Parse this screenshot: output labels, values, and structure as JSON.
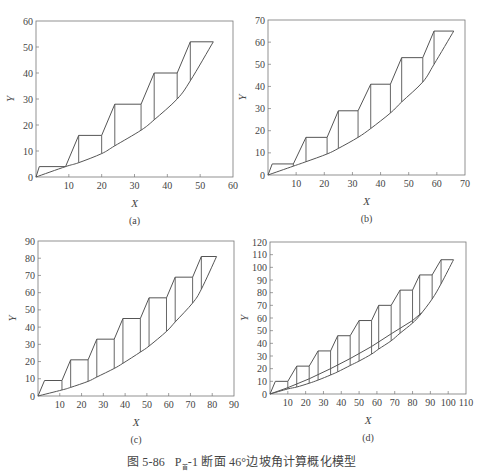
{
  "caption": {
    "figure_no": "图 5-86",
    "section_prefix": "P",
    "section_sub": "首",
    "section_suffix": "-1 断面 46°边坡角计算概化模型"
  },
  "chart_data": [
    {
      "id": "a",
      "type": "line",
      "panel_label": "(a)",
      "xlabel": "X",
      "ylabel": "Y",
      "xlim": [
        0,
        60
      ],
      "ylim": [
        0,
        60
      ],
      "xticks": [
        10,
        20,
        30,
        40,
        50,
        60
      ],
      "yticks": [
        0,
        10,
        20,
        30,
        40,
        50,
        60
      ],
      "frame_px": {
        "left": 36,
        "top": 21,
        "right": 233,
        "bottom": 177
      },
      "series": [
        {
          "name": "slope-profile",
          "points": [
            [
              0,
              0
            ],
            [
              1,
              4
            ],
            [
              9,
              4
            ],
            [
              13,
              16
            ],
            [
              20,
              16
            ],
            [
              24,
              28
            ],
            [
              32,
              28
            ],
            [
              36,
              40
            ],
            [
              43,
              40
            ],
            [
              47,
              52
            ],
            [
              54,
              52
            ]
          ]
        },
        {
          "name": "slip-surface",
          "points": [
            [
              0,
              0
            ],
            [
              9,
              4
            ],
            [
              13,
              5.5
            ],
            [
              20,
              9
            ],
            [
              24,
              12
            ],
            [
              32,
              18
            ],
            [
              36,
              22
            ],
            [
              43,
              30
            ],
            [
              47,
              37
            ],
            [
              54,
              52
            ]
          ]
        }
      ],
      "slice_lines_x": [
        9,
        13,
        20,
        24,
        32,
        36,
        43,
        47
      ]
    },
    {
      "id": "b",
      "type": "line",
      "panel_label": "(b)",
      "xlabel": "X",
      "ylabel": "Y",
      "xlim": [
        0,
        70
      ],
      "ylim": [
        0,
        70
      ],
      "xticks": [
        10,
        20,
        30,
        40,
        50,
        60,
        70
      ],
      "yticks": [
        0,
        10,
        20,
        30,
        40,
        50,
        60,
        70
      ],
      "frame_px": {
        "left": 268,
        "top": 20,
        "right": 465,
        "bottom": 175
      },
      "series": [
        {
          "name": "slope-profile",
          "points": [
            [
              0,
              0
            ],
            [
              1.5,
              5
            ],
            [
              9,
              5
            ],
            [
              13.5,
              17
            ],
            [
              21,
              17
            ],
            [
              25,
              29
            ],
            [
              32,
              29
            ],
            [
              36.5,
              41
            ],
            [
              43.5,
              41
            ],
            [
              47.5,
              53
            ],
            [
              55,
              53
            ],
            [
              59,
              65
            ],
            [
              66,
              65
            ]
          ]
        },
        {
          "name": "slip-surface",
          "points": [
            [
              0,
              0
            ],
            [
              9,
              4
            ],
            [
              13.5,
              6
            ],
            [
              21,
              9.5
            ],
            [
              25,
              12
            ],
            [
              32,
              17
            ],
            [
              36.5,
              21
            ],
            [
              43.5,
              28
            ],
            [
              47.5,
              33
            ],
            [
              55,
              42
            ],
            [
              59,
              50
            ],
            [
              66,
              65
            ]
          ]
        }
      ],
      "slice_lines_x": [
        9,
        13.5,
        21,
        25,
        32,
        36.5,
        43.5,
        47.5,
        55,
        59
      ]
    },
    {
      "id": "c",
      "type": "line",
      "panel_label": "(c)",
      "xlabel": "X",
      "ylabel": "Y",
      "xlim": [
        0,
        90
      ],
      "ylim": [
        0,
        90
      ],
      "xticks": [
        10,
        20,
        30,
        40,
        50,
        60,
        70,
        80,
        90
      ],
      "yticks": [
        0,
        10,
        20,
        30,
        40,
        50,
        60,
        70,
        80,
        90
      ],
      "frame_px": {
        "left": 38,
        "top": 241,
        "right": 234,
        "bottom": 396
      },
      "series": [
        {
          "name": "slope-profile",
          "points": [
            [
              0,
              0
            ],
            [
              3,
              9
            ],
            [
              11,
              9
            ],
            [
              15,
              21
            ],
            [
              23,
              21
            ],
            [
              27,
              33
            ],
            [
              35,
              33
            ],
            [
              39,
              45
            ],
            [
              47,
              45
            ],
            [
              51,
              57
            ],
            [
              59,
              57
            ],
            [
              63,
              69
            ],
            [
              71,
              69
            ],
            [
              75,
              81
            ],
            [
              82,
              81
            ]
          ]
        },
        {
          "name": "slip-surface",
          "points": [
            [
              0,
              0
            ],
            [
              11,
              3.5
            ],
            [
              15,
              5
            ],
            [
              23,
              8.5
            ],
            [
              27,
              11
            ],
            [
              35,
              16
            ],
            [
              39,
              19
            ],
            [
              47,
              25.5
            ],
            [
              51,
              29
            ],
            [
              59,
              37.5
            ],
            [
              63,
              43
            ],
            [
              71,
              54
            ],
            [
              75,
              62
            ],
            [
              82,
              81
            ]
          ]
        }
      ],
      "slice_lines_x": [
        11,
        15,
        23,
        27,
        35,
        39,
        47,
        51,
        59,
        63,
        71,
        75
      ]
    },
    {
      "id": "d",
      "type": "line",
      "panel_label": "(d)",
      "xlabel": "X",
      "ylabel": "Y",
      "xlim": [
        0,
        110
      ],
      "ylim": [
        0,
        120
      ],
      "xticks": [
        10,
        20,
        30,
        40,
        50,
        60,
        70,
        80,
        90,
        100,
        110
      ],
      "yticks": [
        0,
        10,
        20,
        30,
        40,
        50,
        60,
        70,
        80,
        90,
        100,
        110,
        120
      ],
      "frame_px": {
        "left": 270,
        "top": 242,
        "right": 466,
        "bottom": 394
      },
      "series": [
        {
          "name": "slope-profile",
          "points": [
            [
              0,
              0
            ],
            [
              3,
              10
            ],
            [
              10,
              10
            ],
            [
              15,
              22
            ],
            [
              22,
              22
            ],
            [
              27,
              34
            ],
            [
              34,
              34
            ],
            [
              38,
              46
            ],
            [
              45,
              46
            ],
            [
              50,
              58
            ],
            [
              57,
              58
            ],
            [
              61,
              70
            ],
            [
              68,
              70
            ],
            [
              73,
              82
            ],
            [
              80,
              82
            ],
            [
              84,
              94
            ],
            [
              91,
              94
            ],
            [
              96,
              106
            ],
            [
              103,
              106
            ]
          ]
        },
        {
          "name": "slip-surface",
          "points": [
            [
              0,
              0
            ],
            [
              10,
              4
            ],
            [
              15,
              5.5
            ],
            [
              22,
              8.5
            ],
            [
              27,
              11
            ],
            [
              34,
              15
            ],
            [
              38,
              17.5
            ],
            [
              45,
              22.5
            ],
            [
              50,
              26
            ],
            [
              57,
              31.5
            ],
            [
              61,
              35.5
            ],
            [
              68,
              42
            ],
            [
              73,
              48
            ],
            [
              80,
              56
            ],
            [
              84,
              62
            ],
            [
              91,
              75
            ],
            [
              96,
              87
            ],
            [
              103,
              106
            ]
          ]
        },
        {
          "name": "secondary-surface",
          "points": [
            [
              0,
              0
            ],
            [
              10,
              5
            ],
            [
              22,
              12
            ],
            [
              34,
              20
            ],
            [
              45,
              28
            ],
            [
              57,
              37.5
            ],
            [
              68,
              47.5
            ],
            [
              80,
              58
            ],
            [
              85,
              64
            ]
          ]
        }
      ],
      "slice_lines_x": [
        10,
        15,
        22,
        27,
        34,
        38,
        45,
        50,
        57,
        61,
        68,
        73,
        80,
        84,
        91,
        96
      ]
    }
  ]
}
